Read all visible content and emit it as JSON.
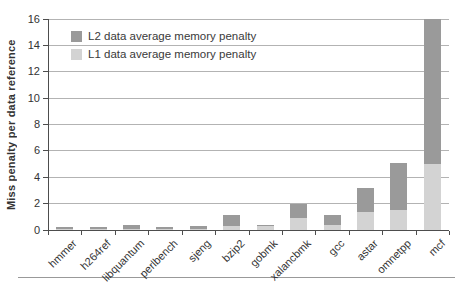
{
  "chart_data": {
    "type": "bar",
    "stacked": true,
    "title": "",
    "xlabel": "",
    "ylabel": "Miss penalty per data reference",
    "ylim": [
      0,
      16
    ],
    "yticks": [
      0,
      2,
      4,
      6,
      8,
      10,
      12,
      14,
      16
    ],
    "grid": true,
    "legend_position": "top-left-inside",
    "categories": [
      "hmmer",
      "h264ref",
      "libquantum",
      "perlbench",
      "sjeng",
      "bzip2",
      "gobmk",
      "xalancbmk",
      "gcc",
      "astar",
      "omnetpp",
      "mcf"
    ],
    "series": [
      {
        "name": "L2 data average memory penalty",
        "color": "#9a9a9a",
        "stack_level": "top",
        "values": [
          0.2,
          0.15,
          0.3,
          0.2,
          0.2,
          0.85,
          0.1,
          1.1,
          0.8,
          1.75,
          3.6,
          11.0
        ]
      },
      {
        "name": "L1 data average memory penalty",
        "color": "#d3d3d3",
        "stack_level": "bottom",
        "values": [
          0.05,
          0.05,
          0.05,
          0.05,
          0.1,
          0.3,
          0.3,
          0.9,
          0.35,
          1.4,
          1.5,
          5.0
        ]
      }
    ],
    "totals": [
      0.25,
      0.2,
      0.35,
      0.25,
      0.3,
      1.15,
      0.4,
      2.0,
      1.15,
      3.15,
      5.1,
      16.0
    ]
  },
  "figure": {
    "background": "#ffffff",
    "gridline_color": "#b3b3b3",
    "axis_color": "#4d4d4d",
    "text_color": "#333333",
    "bottom_rule_color": "#999999"
  }
}
